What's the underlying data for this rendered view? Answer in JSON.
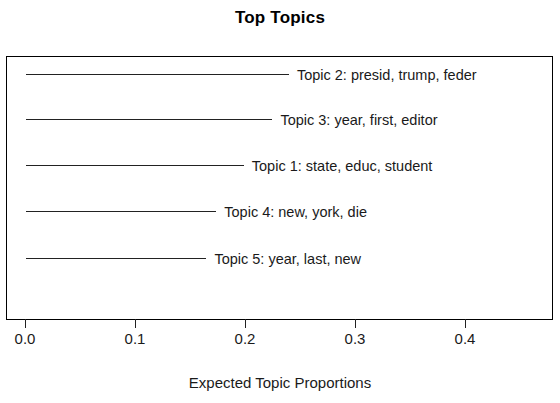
{
  "chart_data": {
    "type": "bar",
    "title": "Top Topics",
    "xlabel": "Expected Topic Proportions",
    "ylabel": "",
    "xlim": [
      0.0,
      0.4818
    ],
    "grid": false,
    "legend": "none",
    "orientation": "horizontal",
    "xticks": [
      "0.0",
      "0.1",
      "0.2",
      "0.3",
      "0.4"
    ],
    "xtick_values": [
      0.0,
      0.1,
      0.2,
      0.3,
      0.4
    ],
    "categories": [
      "Topic 2: presid, trump, feder",
      "Topic 3: year, first, editor",
      "Topic 1: state, educ, student",
      "Topic 4: new, york, die",
      "Topic 5: year, last, new"
    ],
    "values": [
      0.239,
      0.224,
      0.198,
      0.173,
      0.164
    ],
    "series": [
      {
        "name": "Expected Topic Proportions",
        "values": [
          0.239,
          0.224,
          0.198,
          0.173,
          0.164
        ]
      }
    ],
    "points": [
      {
        "label": "Topic 2: presid, trump, feder",
        "topic": "Topic 2",
        "terms": "presid, trump, feder",
        "value": 0.239
      },
      {
        "label": "Topic 3: year, first, editor",
        "topic": "Topic 3",
        "terms": "year, first, editor",
        "value": 0.224
      },
      {
        "label": "Topic 1: state, educ, student",
        "topic": "Topic 1",
        "terms": "state, educ, student",
        "value": 0.198
      },
      {
        "label": "Topic 4: new, york, die",
        "topic": "Topic 4",
        "terms": "new, york, die",
        "value": 0.173
      },
      {
        "label": "Topic 5: year, last, new",
        "topic": "Topic 5",
        "terms": "year, last, new",
        "value": 0.164
      }
    ],
    "colors": {
      "line": "#222222",
      "frame": "#000000",
      "text": "#1a1a1a",
      "background": "#ffffff"
    }
  }
}
